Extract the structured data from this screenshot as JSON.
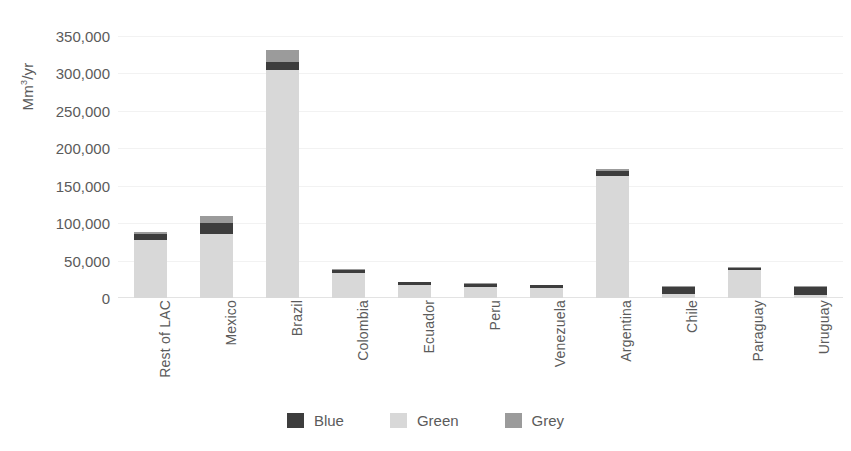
{
  "chart_data": {
    "type": "bar",
    "subtype": "stacked-vertical",
    "title": "",
    "xlabel": "",
    "ylabel": "Mm3/yr",
    "ylabel_display": "Mm",
    "ylabel_sup": "3",
    "ylabel_tail": "/yr",
    "ylim": [
      0,
      350000
    ],
    "ytick_step": 50000,
    "ytick_labels": [
      "0",
      "50,000",
      "100,000",
      "150,000",
      "200,000",
      "250,000",
      "300,000",
      "350,000"
    ],
    "ytick_values": [
      0,
      50000,
      100000,
      150000,
      200000,
      250000,
      300000,
      350000
    ],
    "grid": true,
    "grid_axis": "y",
    "legend_position": "bottom",
    "categories": [
      "Rest of LAC",
      "Mexico",
      "Brazil",
      "Colombia",
      "Ecuador",
      "Peru",
      "Venezuela",
      "Argentina",
      "Chile",
      "Paraguay",
      "Uruguay"
    ],
    "series": [
      {
        "name": "Green",
        "color": "#d8d8d8",
        "values": [
          78000,
          86000,
          305000,
          34000,
          18000,
          15000,
          13000,
          163000,
          5000,
          38000,
          4000
        ]
      },
      {
        "name": "Blue",
        "color": "#3d3d3d",
        "values": [
          7000,
          14000,
          10000,
          3000,
          3000,
          4000,
          4000,
          7000,
          10000,
          2000,
          11000
        ]
      },
      {
        "name": "Grey",
        "color": "#9b9b9b",
        "values": [
          3000,
          10000,
          16000,
          2000,
          1000,
          1000,
          1000,
          3000,
          1000,
          1000,
          1000
        ]
      }
    ],
    "totals": [
      88000,
      110000,
      331000,
      39000,
      22000,
      20000,
      18000,
      173000,
      16000,
      41000,
      16000
    ],
    "legend": [
      {
        "label": "Blue",
        "color": "#3d3d3d"
      },
      {
        "label": "Green",
        "color": "#d8d8d8"
      },
      {
        "label": "Grey",
        "color": "#9b9b9b"
      }
    ]
  },
  "colors": {
    "blue": "#3d3d3d",
    "green": "#d8d8d8",
    "grey": "#9b9b9b",
    "text": "#5b5b5b",
    "grid": "#f2f2f2",
    "background": "#ffffff"
  }
}
